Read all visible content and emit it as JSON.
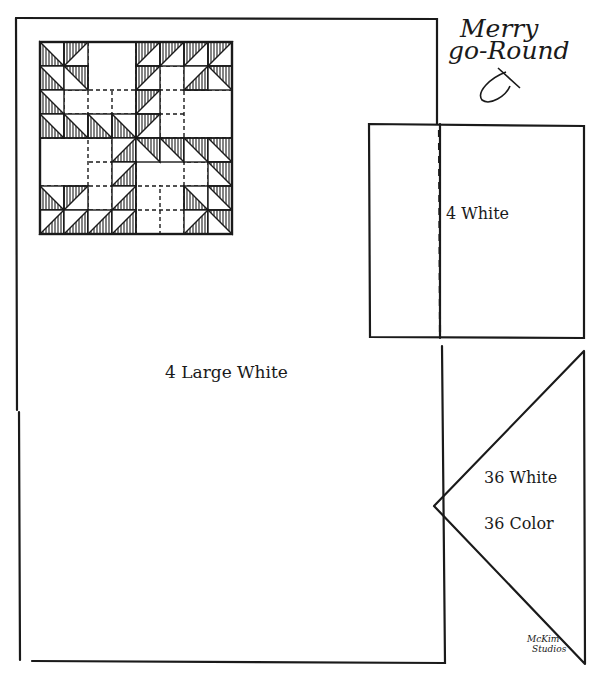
{
  "title": {
    "line1": "Merry",
    "line2": "go-Round"
  },
  "labels": {
    "large_white": "4 Large White",
    "square_white": "4 White",
    "triangle_white": "36 White",
    "triangle_color": "36 Color"
  },
  "credit": {
    "line1": "McKim",
    "line2": "Studios"
  },
  "colors": {
    "ink": "#1a1a1a",
    "paper": "#ffffff"
  },
  "block": {
    "x": 40,
    "y": 42,
    "cell": 24,
    "size": 8,
    "hatched_triangles": [
      [
        0,
        0,
        "bl"
      ],
      [
        0,
        1,
        "tl"
      ],
      [
        0,
        4,
        "tl"
      ],
      [
        0,
        5,
        "tl"
      ],
      [
        0,
        6,
        "tl"
      ],
      [
        0,
        7,
        "tl"
      ],
      [
        1,
        0,
        "bl"
      ],
      [
        1,
        1,
        "tr"
      ],
      [
        1,
        4,
        "tl"
      ],
      [
        1,
        6,
        "br"
      ],
      [
        1,
        7,
        "tr"
      ],
      [
        2,
        0,
        "bl"
      ],
      [
        2,
        4,
        "tl"
      ],
      [
        3,
        0,
        "bl"
      ],
      [
        3,
        1,
        "bl"
      ],
      [
        3,
        2,
        "bl"
      ],
      [
        3,
        3,
        "bl"
      ],
      [
        3,
        4,
        "tl"
      ],
      [
        4,
        3,
        "br"
      ],
      [
        4,
        4,
        "tr"
      ],
      [
        4,
        5,
        "tr"
      ],
      [
        4,
        6,
        "tr"
      ],
      [
        4,
        7,
        "tr"
      ],
      [
        5,
        3,
        "br"
      ],
      [
        5,
        7,
        "tr"
      ],
      [
        6,
        0,
        "bl"
      ],
      [
        6,
        1,
        "tl"
      ],
      [
        6,
        3,
        "br"
      ],
      [
        6,
        6,
        "bl"
      ],
      [
        6,
        7,
        "tr"
      ],
      [
        7,
        0,
        "br"
      ],
      [
        7,
        1,
        "br"
      ],
      [
        7,
        2,
        "br"
      ],
      [
        7,
        3,
        "br"
      ],
      [
        7,
        6,
        "br"
      ],
      [
        7,
        7,
        "tr"
      ]
    ],
    "large_squares": [
      [
        0,
        2,
        2,
        2
      ],
      [
        2,
        6,
        2,
        2
      ],
      [
        4,
        0,
        2,
        2
      ],
      [
        4,
        4,
        2,
        2
      ]
    ]
  }
}
